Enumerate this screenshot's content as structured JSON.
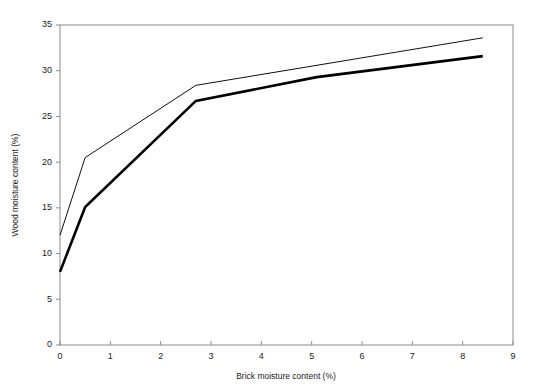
{
  "chart_data": {
    "type": "line",
    "title": "",
    "subtitle": "",
    "xlabel": "Brick moisture content (%)",
    "ylabel": "Wood moisture content (%)",
    "xlim": [
      0,
      9
    ],
    "ylim": [
      0,
      35
    ],
    "xticks": [
      0,
      1,
      2,
      3,
      4,
      5,
      6,
      7,
      8,
      9
    ],
    "yticks": [
      0,
      5,
      10,
      15,
      20,
      25,
      30,
      35
    ],
    "xtick_labels": [
      "0",
      "1",
      "2",
      "3",
      "4",
      "5",
      "6",
      "7",
      "8",
      "9"
    ],
    "ytick_labels": [
      "0",
      "5",
      "10",
      "15",
      "20",
      "25",
      "30",
      "35"
    ],
    "grid": false,
    "legend": "none",
    "frame": "full-box",
    "series": [
      {
        "name": "upper-curve",
        "style": "thin",
        "color": "#111111",
        "linewidth": 1,
        "x": [
          0,
          0.5,
          2.7,
          8.4
        ],
        "y": [
          12.0,
          20.5,
          28.4,
          33.6
        ]
      },
      {
        "name": "lower-curve",
        "style": "thick",
        "color": "#000000",
        "linewidth": 2.6,
        "x": [
          0,
          0.5,
          2.7,
          5.1,
          8.4
        ],
        "y": [
          8.0,
          15.1,
          26.7,
          29.3,
          31.6
        ]
      }
    ],
    "annotations": []
  },
  "axes": {
    "x_title": "Brick moisture content (%)",
    "y_title": "Wood moisture content (%)"
  }
}
